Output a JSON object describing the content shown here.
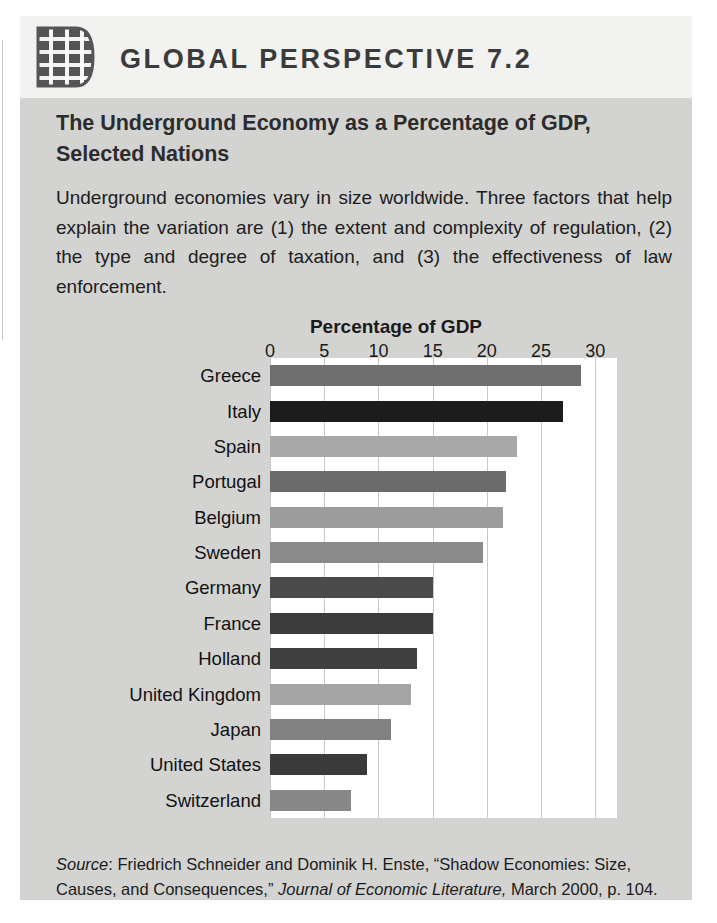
{
  "header": {
    "icon": "globe-grid-icon",
    "title": "GLOBAL PERSPECTIVE 7.2"
  },
  "subtitle": "The Underground Economy as a Percentage of GDP, Selected Nations",
  "intro": "Underground economies vary in size worldwide. Three factors that help explain the variation are (1) the extent and complexity of regulation, (2) the type and degree of taxation, and (3) the effectiveness of law enforcement.",
  "source": {
    "label": "Source",
    "text_1": ": Friedrich Schneider and Dominik H. Enste, “Shadow Economies: Size, Causes, and Consequences,” ",
    "journal": "Journal of Economic Literature,",
    "text_2": " March 2000, p. 104."
  },
  "colors": {
    "box_background": "#d3d3d1",
    "header_background": "#f2f2f0",
    "plot_background": "#ffffff",
    "gridline": "#c8c8c8",
    "text": "#1a1a1a"
  },
  "chart_data": {
    "type": "bar",
    "orientation": "horizontal",
    "title": "Percentage of GDP",
    "xlabel": "Percentage of GDP",
    "ylabel": "",
    "xlim": [
      0,
      32
    ],
    "xticks": [
      0,
      5,
      10,
      15,
      20,
      25,
      30
    ],
    "xtick_labels": [
      "0",
      "5",
      "10",
      "15",
      "20",
      "25",
      "30"
    ],
    "grid": true,
    "legend": "none",
    "categories": [
      "Greece",
      "Italy",
      "Spain",
      "Portugal",
      "Belgium",
      "Sweden",
      "Germany",
      "France",
      "Holland",
      "United Kingdom",
      "Japan",
      "United States",
      "Switzerland"
    ],
    "values": [
      28.7,
      27.0,
      22.8,
      21.8,
      21.5,
      19.6,
      15.0,
      15.0,
      13.6,
      13.0,
      11.2,
      8.9,
      7.5
    ],
    "bar_colors": [
      "#6e6e6e",
      "#1c1c1c",
      "#a8a8a8",
      "#6b6b6b",
      "#9c9c9c",
      "#8a8a8a",
      "#4a4a4a",
      "#3b3b3b",
      "#3f3f3f",
      "#a5a5a5",
      "#818181",
      "#3a3a3a",
      "#878787"
    ]
  }
}
